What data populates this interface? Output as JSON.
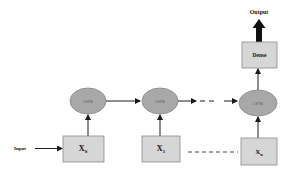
{
  "diagram": {
    "type": "lstm-sequence-architecture",
    "colors": {
      "box_fill": "#d6d6d6",
      "box_stroke": "#8a8a8a",
      "ellipse_fill": "#a8a8a8",
      "ellipse_stroke": "#888888",
      "arrow": "#1a1a1a"
    },
    "input_label": "Input",
    "output_label": "Output",
    "dense_label": "Dense",
    "lstm_cells": [
      {
        "label": "LSTM"
      },
      {
        "label": "LSTM"
      },
      {
        "label": "LSTM"
      }
    ],
    "inputs": [
      {
        "label": "X",
        "subscript": "0"
      },
      {
        "label": "X",
        "subscript": "1"
      },
      {
        "label": "X",
        "subscript": "n"
      }
    ]
  }
}
